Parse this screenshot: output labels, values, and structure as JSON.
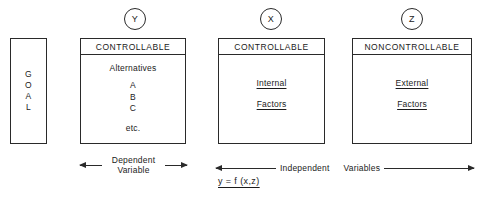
{
  "diagram": {
    "nodes": [
      {
        "id": "y",
        "circle_label": "Y"
      },
      {
        "id": "x",
        "circle_label": "X"
      },
      {
        "id": "z",
        "circle_label": "Z"
      }
    ],
    "goal_box": {
      "letters": [
        "G",
        "O",
        "A",
        "L"
      ],
      "text": "GOAL"
    },
    "boxes": [
      {
        "id": "y",
        "header": "CONTROLLABLE",
        "body_title": "Alternatives",
        "items": [
          "A",
          "B",
          "C"
        ],
        "trailing": "etc."
      },
      {
        "id": "x",
        "header": "CONTROLLABLE",
        "lines": [
          "Internal",
          "Factors"
        ]
      },
      {
        "id": "z",
        "header": "NONCONTROLLABLE",
        "lines": [
          "External",
          "Factors"
        ]
      }
    ],
    "annotations": {
      "dependent_line_1": "Dependent",
      "dependent_line_2": "Variable",
      "independent_label_1": "Independent",
      "independent_label_2": "Variables",
      "formula": "y = f (x,z)"
    },
    "colors": {
      "ink": "#1b1b1b",
      "stroke": "#2a2a2a",
      "background": "#ffffff"
    }
  }
}
